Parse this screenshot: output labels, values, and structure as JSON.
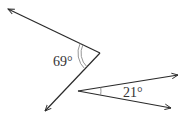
{
  "diagram": {
    "type": "angles",
    "colors": {
      "line": "#2a2a2a",
      "arc": "#8a8a8a",
      "text": "#333333"
    },
    "angles": [
      {
        "label": "69°",
        "value_deg": 69,
        "vertex": [
          100,
          53
        ],
        "ray_ends": [
          [
            8,
            9
          ],
          [
            45,
            111
          ]
        ],
        "arc_count": 2,
        "label_pos": [
          53,
          66
        ]
      },
      {
        "label": "21°",
        "value_deg": 21,
        "vertex": [
          78,
          91
        ],
        "ray_ends": [
          [
            178,
            75
          ],
          [
            171,
            108
          ]
        ],
        "arc_count": 1,
        "label_pos": [
          123,
          97
        ]
      }
    ]
  }
}
